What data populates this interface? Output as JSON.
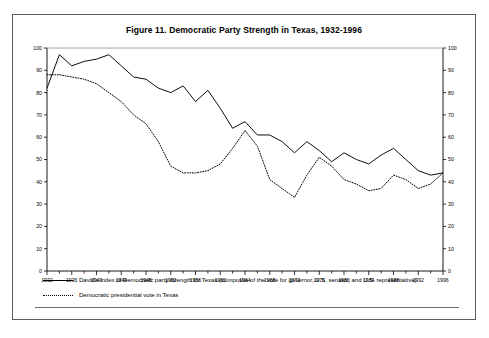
{
  "figure": {
    "title": "Figure 11.  Democratic Party Strength in Texas, 1932-1996"
  },
  "legend": {
    "items": [
      {
        "style": "solid",
        "label": "David's index of Democratic party strength for Texas (composite of the vote for governor, U.S. senator, and U.S. representative)"
      },
      {
        "style": "dotted",
        "label": "Democratic presidential vote in Texas"
      }
    ]
  },
  "chart_data": {
    "type": "line",
    "title": "Figure 11.  Democratic Party Strength in Texas, 1932-1996",
    "xlabel": "",
    "ylabel": "",
    "xlim": [
      1932,
      1996
    ],
    "ylim": [
      0,
      100
    ],
    "grid": false,
    "legend_position": "below",
    "y_ticks": [
      0,
      10,
      20,
      30,
      40,
      50,
      60,
      70,
      80,
      90,
      100
    ],
    "y_tick_labels": [
      "0",
      "10",
      "20",
      "30",
      "40",
      "50",
      "60",
      "70",
      "80",
      "90",
      "100"
    ],
    "dual_y_axis": true,
    "x": [
      1932,
      1934,
      1936,
      1938,
      1940,
      1942,
      1944,
      1946,
      1948,
      1950,
      1952,
      1954,
      1956,
      1958,
      1960,
      1962,
      1964,
      1966,
      1968,
      1970,
      1972,
      1974,
      1976,
      1978,
      1980,
      1982,
      1984,
      1986,
      1988,
      1990,
      1992,
      1994,
      1996
    ],
    "x_ticks": [
      1932,
      1936,
      1940,
      1944,
      1948,
      1952,
      1956,
      1960,
      1964,
      1968,
      1972,
      1976,
      1980,
      1984,
      1988,
      1992,
      1996
    ],
    "x_tick_labels": [
      "1932",
      "1936",
      "1940",
      "1944",
      "1948",
      "1952",
      "1956",
      "1960",
      "1964",
      "1968",
      "1972",
      "1976",
      "1980",
      "1984",
      "1988",
      "1992",
      "1996"
    ],
    "series": [
      {
        "name": "David's index of Democratic party strength for Texas (composite of the vote for governor, U.S. senator, and U.S. representative)",
        "style": "solid",
        "color": "#000000",
        "values": [
          82,
          97,
          92,
          94,
          95,
          97,
          92,
          87,
          86,
          82,
          80,
          83,
          76,
          81,
          73,
          64,
          67,
          61,
          61,
          58,
          53,
          58,
          54,
          49,
          53,
          50,
          48,
          52,
          55,
          50,
          45,
          43,
          44
        ]
      },
      {
        "name": "Democratic presidential vote in Texas",
        "style": "dotted",
        "color": "#000000",
        "values": [
          88,
          88,
          87,
          86,
          84,
          80,
          76,
          70,
          66,
          58,
          47,
          44,
          44,
          45,
          48,
          55,
          63,
          56,
          41,
          37,
          33,
          43,
          51,
          47,
          41,
          39,
          36,
          37,
          43,
          41,
          37,
          39,
          44
        ]
      }
    ]
  }
}
